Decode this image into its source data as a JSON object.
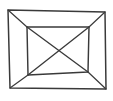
{
  "figure": {
    "canvas": {
      "width": 113,
      "height": 101,
      "background_color": "#fdfdfd"
    },
    "style": {
      "stroke_color": "#3a3a3a",
      "fill_color": "#ffffff",
      "stroke_width": 1.35
    },
    "vertices": {
      "outer_top_left": {
        "label": "outer-top-left",
        "x": 8,
        "y": 10
      },
      "outer_top_right": {
        "label": "outer-top-right",
        "x": 105,
        "y": 12
      },
      "outer_bottom_right": {
        "label": "outer-bottom-right",
        "x": 106,
        "y": 89
      },
      "outer_bottom_left": {
        "label": "outer-bottom-left",
        "x": 10,
        "y": 88
      },
      "inner_top_left": {
        "label": "inner-top-left",
        "x": 27,
        "y": 27
      },
      "inner_top_right": {
        "label": "inner-top-right",
        "x": 89,
        "y": 27
      },
      "inner_bottom_right": {
        "label": "inner-bottom-right",
        "x": 88,
        "y": 72
      },
      "inner_bottom_left": {
        "label": "inner-bottom-left",
        "x": 28,
        "y": 75
      },
      "diagonal_crossing": {
        "label": "diagonal-crossing-center",
        "x": 57,
        "y": 50
      }
    },
    "paths": {
      "outer_quad": "M 8 10 L 105 12 L 106 89 L 10 88 Z",
      "inner_quad": "M 27 27 L 89 27 L 88 72 L 28 75 Z",
      "connector_top_left": "M 8 10 L 27 27",
      "connector_top_right": "M 105 12 L 89 27",
      "connector_bottom_right": "M 106 89 L 88 72",
      "connector_bottom_left": "M 10 88 L 28 75",
      "diagonal_tl_br": "M 27 27 L 88 72",
      "diagonal_tr_bl": "M 89 27 L 28 75"
    },
    "edge_names": {
      "outer_quad": "outer-quadrilateral",
      "inner_quad": "inner-quadrilateral",
      "connector_top_left": "connector-edge-top-left",
      "connector_top_right": "connector-edge-top-right",
      "connector_bottom_right": "connector-edge-bottom-right",
      "connector_bottom_left": "connector-edge-bottom-left",
      "diagonal_tl_br": "diagonal-top-left-to-bottom-right",
      "diagonal_tr_bl": "diagonal-top-right-to-bottom-left"
    }
  }
}
